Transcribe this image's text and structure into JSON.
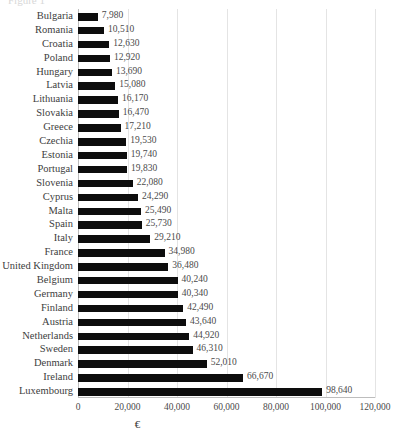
{
  "title_fragment": "Figure 1",
  "chart_data": {
    "type": "bar",
    "orientation": "horizontal",
    "title": "",
    "xlabel": "€",
    "ylabel": "",
    "xlim": [
      0,
      120000
    ],
    "grid": true,
    "legend": false,
    "bar_color": "#0d0d0d",
    "gridline_color": "#e4e4e4",
    "xticks": [
      "0",
      "20,000",
      "40,000",
      "60,000",
      "80,000",
      "100,000",
      "120,000"
    ],
    "xtick_values": [
      0,
      20000,
      40000,
      60000,
      80000,
      100000,
      120000
    ],
    "categories": [
      "Bulgaria",
      "Romania",
      "Croatia",
      "Poland",
      "Hungary",
      "Latvia",
      "Lithuania",
      "Slovakia",
      "Greece",
      "Czechia",
      "Estonia",
      "Portugal",
      "Slovenia",
      "Cyprus",
      "Malta",
      "Spain",
      "Italy",
      "France",
      "United Kingdom",
      "Belgium",
      "Germany",
      "Finland",
      "Austria",
      "Netherlands",
      "Sweden",
      "Denmark",
      "Ireland",
      "Luxembourg"
    ],
    "values": [
      7980,
      10510,
      12630,
      12920,
      13690,
      15080,
      16170,
      16470,
      17210,
      19530,
      19740,
      19830,
      22080,
      24290,
      25490,
      25730,
      29210,
      34980,
      36480,
      40240,
      40340,
      42490,
      43640,
      44920,
      46310,
      52010,
      66670,
      98640
    ],
    "value_labels": [
      "7,980",
      "10,510",
      "12,630",
      "12,920",
      "13,690",
      "15,080",
      "16,170",
      "16,470",
      "17,210",
      "19,530",
      "19,740",
      "19,830",
      "22,080",
      "24,290",
      "25,490",
      "25,730",
      "29,210",
      "34,980",
      "36,480",
      "40,240",
      "40,340",
      "42,490",
      "43,640",
      "44,920",
      "46,310",
      "52,010",
      "66,670",
      "98,640"
    ]
  }
}
